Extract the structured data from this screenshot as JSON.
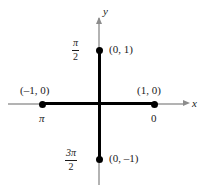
{
  "figure": {
    "type": "unit-circle-coordinate-diagram",
    "axes": {
      "x_label": "x",
      "y_label": "y",
      "x_axis_color": "#b3b3b3",
      "y_axis_color": "#b3b3b3",
      "highlight_color": "#000000"
    },
    "points": [
      {
        "id": "right",
        "coordinate_label": "(1, 0)",
        "angle_label": "0",
        "angle_label_kind": "plain",
        "position": "right"
      },
      {
        "id": "top",
        "coordinate_label": "(0, 1)",
        "angle_numerator": "π",
        "angle_denominator": "2",
        "angle_label_kind": "fraction",
        "position": "top"
      },
      {
        "id": "left",
        "coordinate_label": "(–1, 0)",
        "angle_label": "π",
        "angle_label_kind": "plain",
        "position": "left"
      },
      {
        "id": "bottom",
        "coordinate_label": "(0, –1)",
        "angle_numerator": "3π",
        "angle_denominator": "2",
        "angle_label_kind": "fraction",
        "position": "bottom"
      }
    ]
  }
}
